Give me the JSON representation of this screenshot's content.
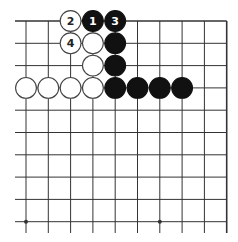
{
  "diagram": {
    "type": "go-board-fragment",
    "columns": 10,
    "rows": 10,
    "edges": {
      "top": true,
      "right": true,
      "left": false,
      "bottom": false
    },
    "star_points": [
      {
        "col": 0,
        "row": 9
      },
      {
        "col": 6,
        "row": 9
      }
    ],
    "colors": {
      "line": "#333333",
      "black_stone": "#111111",
      "white_stone": "#ffffff",
      "white_stone_border": "#444444",
      "label_on_black": "#ffffff",
      "label_on_white": "#222222"
    },
    "stones": [
      {
        "col": 2,
        "row": 0,
        "color": "white",
        "label": "2"
      },
      {
        "col": 3,
        "row": 0,
        "color": "black",
        "label": "1"
      },
      {
        "col": 4,
        "row": 0,
        "color": "black",
        "label": "3"
      },
      {
        "col": 2,
        "row": 1,
        "color": "white",
        "label": "4"
      },
      {
        "col": 3,
        "row": 1,
        "color": "white",
        "label": ""
      },
      {
        "col": 4,
        "row": 1,
        "color": "black",
        "label": ""
      },
      {
        "col": 3,
        "row": 2,
        "color": "white",
        "label": ""
      },
      {
        "col": 4,
        "row": 2,
        "color": "black",
        "label": ""
      },
      {
        "col": 0,
        "row": 3,
        "color": "white",
        "label": ""
      },
      {
        "col": 1,
        "row": 3,
        "color": "white",
        "label": ""
      },
      {
        "col": 2,
        "row": 3,
        "color": "white",
        "label": ""
      },
      {
        "col": 3,
        "row": 3,
        "color": "white",
        "label": ""
      },
      {
        "col": 4,
        "row": 3,
        "color": "black",
        "label": ""
      },
      {
        "col": 5,
        "row": 3,
        "color": "black",
        "label": ""
      },
      {
        "col": 6,
        "row": 3,
        "color": "black",
        "label": ""
      },
      {
        "col": 7,
        "row": 3,
        "color": "black",
        "label": ""
      }
    ]
  }
}
